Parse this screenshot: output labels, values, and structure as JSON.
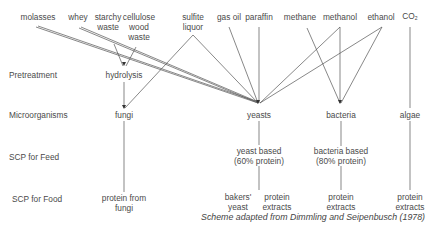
{
  "sources": [
    {
      "id": "molasses",
      "label": "molasses"
    },
    {
      "id": "whey",
      "label": "whey"
    },
    {
      "id": "starchy_waste",
      "label": "starchy\nwaste"
    },
    {
      "id": "cellulose",
      "label": "cellulose\nwood\nwaste"
    },
    {
      "id": "sulfite",
      "label": "sulfite\nliquor"
    },
    {
      "id": "gas_oil",
      "label": "gas oil"
    },
    {
      "id": "paraffin",
      "label": "paraffin"
    },
    {
      "id": "methane",
      "label": "methane"
    },
    {
      "id": "methanol",
      "label": "methanol"
    },
    {
      "id": "ethanol",
      "label": "ethanol"
    },
    {
      "id": "co2",
      "label": "CO₂"
    }
  ],
  "rows": {
    "pretreatment": "Pretreatment",
    "microorganisms": "Microorganisms",
    "scp_feed": "SCP for Feed",
    "scp_food": "SCP for Food"
  },
  "nodes": {
    "hydrolysis": "hydrolysis",
    "fungi": "fungi",
    "yeasts": "yeasts",
    "bacteria": "bacteria",
    "algae": "algae",
    "yeast_based_1": "yeast based",
    "yeast_based_2": "(60% protein)",
    "bacteria_based_1": "bacteria based",
    "bacteria_based_2": "(80% protein)",
    "protein_fungi_1": "protein from",
    "protein_fungi_2": "fungi",
    "bakers_1": "bakers'",
    "bakers_2": "yeast",
    "pe_yeast_1": "protein",
    "pe_yeast_2": "extracts",
    "pe_bact_1": "protein",
    "pe_bact_2": "extracts",
    "pe_algae_1": "protein",
    "pe_algae_2": "extracts"
  },
  "edges": [
    [
      "molasses",
      "yeasts"
    ],
    [
      "whey",
      "yeasts"
    ],
    [
      "starchy_waste",
      "hydrolysis"
    ],
    [
      "cellulose",
      "hydrolysis"
    ],
    [
      "sulfite",
      "fungi"
    ],
    [
      "sulfite",
      "yeasts"
    ],
    [
      "gas_oil",
      "yeasts"
    ],
    [
      "paraffin",
      "yeasts"
    ],
    [
      "methane",
      "bacteria"
    ],
    [
      "methanol",
      "yeasts"
    ],
    [
      "methanol",
      "bacteria"
    ],
    [
      "ethanol",
      "yeasts"
    ],
    [
      "ethanol",
      "bacteria"
    ],
    [
      "co2",
      "algae"
    ],
    [
      "hydrolysis",
      "fungi"
    ],
    [
      "fungi",
      "protein from fungi"
    ],
    [
      "yeasts",
      "yeast based"
    ],
    [
      "yeast based",
      "bakers' yeast"
    ],
    [
      "yeast based",
      "protein extracts"
    ],
    [
      "bacteria",
      "bacteria based"
    ],
    [
      "bacteria based",
      "protein extracts"
    ],
    [
      "algae",
      "protein extracts"
    ]
  ],
  "caption": "Scheme adapted from Dimmling and Seipenbusch (1978)"
}
